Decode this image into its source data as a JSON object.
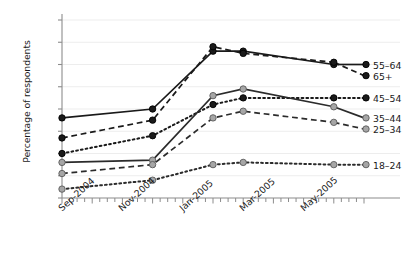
{
  "chart_data": {
    "type": "line",
    "title": "",
    "xlabel": "",
    "ylabel": "Percentage of respondents",
    "xlim": [
      0,
      10
    ],
    "ylim": [
      0,
      80
    ],
    "grid": true,
    "legend_position": "right",
    "x": [
      "Sep-2004",
      "Dec-2004",
      "Feb-2005",
      "Mar-2005",
      "Jun-2005"
    ],
    "x_positions": [
      0,
      3,
      5,
      6,
      9
    ],
    "xtick_labels": [
      "Sep-2004",
      "Nov-2004",
      "Jan-2005",
      "Mar-2005",
      "May-2005"
    ],
    "xtick_positions": [
      0,
      2,
      4,
      6,
      8
    ],
    "ytick_labels": [
      "0%",
      "10%",
      "20%",
      "30%",
      "40%",
      "50%",
      "60%",
      "70%",
      "80%"
    ],
    "ytick_values": [
      0,
      10,
      20,
      30,
      40,
      50,
      60,
      70,
      80
    ],
    "series": [
      {
        "name": "55–64",
        "values": [
          36,
          40,
          66,
          66,
          60
        ],
        "color": "#1a1a1a",
        "marker_color": "#1a1a1a",
        "dash": "solid",
        "label_y": 60
      },
      {
        "name": "65+",
        "values": [
          27,
          35,
          68,
          65,
          61
        ],
        "color": "#1a1a1a",
        "marker_color": "#1a1a1a",
        "dash": "dashed",
        "label_y": 55
      },
      {
        "name": "45–54",
        "values": [
          20,
          28,
          42,
          45,
          45
        ],
        "color": "#1a1a1a",
        "marker_color": "#1a1a1a",
        "dash": "dotted",
        "label_y": 45
      },
      {
        "name": "35–44",
        "values": [
          16,
          17,
          46,
          49,
          41
        ],
        "color": "#2b2b2b",
        "marker_color": "#a6a6a6",
        "dash": "solid",
        "label_y": 36
      },
      {
        "name": "25–34",
        "values": [
          11,
          15,
          36,
          39,
          34
        ],
        "color": "#2b2b2b",
        "marker_color": "#a6a6a6",
        "dash": "dashed",
        "label_y": 31
      },
      {
        "name": "18–24",
        "values": [
          4,
          8,
          15,
          16,
          15
        ],
        "color": "#2b2b2b",
        "marker_color": "#a6a6a6",
        "dash": "dotted",
        "label_y": 15
      }
    ]
  },
  "colors": {
    "axis": "#8c8c8c",
    "grid": "#ededed",
    "text": "#1a1a1a",
    "dark_marker": "#1a1a1a",
    "light_marker": "#a6a6a6"
  }
}
